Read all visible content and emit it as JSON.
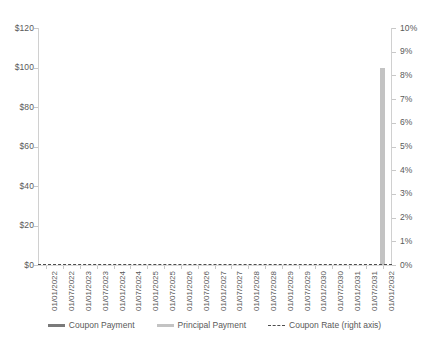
{
  "chart_data": {
    "type": "bar",
    "title": "",
    "subtitle": "",
    "xlabel": "",
    "ylabel": "",
    "y2label": "",
    "grid": false,
    "legend_position": "bottom",
    "ylim": [
      0,
      120
    ],
    "y2lim": [
      0,
      10
    ],
    "y_tick_labels": [
      "$120",
      "$100",
      "$80",
      "$60",
      "$40",
      "$20",
      "$0"
    ],
    "y_tick_values": [
      120,
      100,
      80,
      60,
      40,
      20,
      0
    ],
    "y2_tick_labels": [
      "10%",
      "9%",
      "8%",
      "7%",
      "6%",
      "5%",
      "4%",
      "3%",
      "2%",
      "1%",
      "0%"
    ],
    "y2_tick_values": [
      10,
      9,
      8,
      7,
      6,
      5,
      4,
      3,
      2,
      1,
      0
    ],
    "categories": [
      "01/01/2022",
      "01/07/2022",
      "01/01/2023",
      "01/07/2023",
      "01/01/2024",
      "01/07/2024",
      "01/01/2025",
      "01/07/2025",
      "01/01/2026",
      "01/07/2026",
      "01/01/2027",
      "01/07/2027",
      "01/01/2028",
      "01/07/2028",
      "01/01/2029",
      "01/07/2029",
      "01/01/2030",
      "01/07/2030",
      "01/01/2031",
      "01/07/2031",
      "01/01/2032"
    ],
    "series": [
      {
        "name": "Coupon Payment",
        "type": "bar",
        "axis": "left",
        "color": "#7a7a7a",
        "values": [
          0,
          0,
          0,
          0,
          0,
          0,
          0,
          0,
          0,
          0,
          0,
          0,
          0,
          0,
          0,
          0,
          0,
          0,
          0,
          0,
          0
        ]
      },
      {
        "name": "Principal Payment",
        "type": "bar",
        "axis": "left",
        "color": "#c3c3c3",
        "values": [
          0,
          0,
          0,
          0,
          0,
          0,
          0,
          0,
          0,
          0,
          0,
          0,
          0,
          0,
          0,
          0,
          0,
          0,
          0,
          0,
          100
        ]
      },
      {
        "name": "Coupon Rate (right axis)",
        "type": "line",
        "axis": "right",
        "color": "#4d4d4d",
        "dash": true,
        "values": [
          0,
          0,
          0,
          0,
          0,
          0,
          0,
          0,
          0,
          0,
          0,
          0,
          0,
          0,
          0,
          0,
          0,
          0,
          0,
          0,
          0
        ]
      }
    ]
  },
  "legend": {
    "items": [
      {
        "label": "Coupon Payment",
        "marker": "bar-swatch",
        "color": "#7a7a7a"
      },
      {
        "label": "Principal Payment",
        "marker": "bar-swatch",
        "color": "#c3c3c3"
      },
      {
        "label": "Coupon Rate (right axis)",
        "marker": "dashed-line-swatch",
        "color": "#4d4d4d"
      }
    ]
  },
  "colors": {
    "coupon_payment": "#7a7a7a",
    "principal_payment": "#c3c3c3",
    "coupon_rate": "#4d4d4d",
    "axis": "#d0d0d0",
    "text": "#595959",
    "background": "#ffffff"
  }
}
